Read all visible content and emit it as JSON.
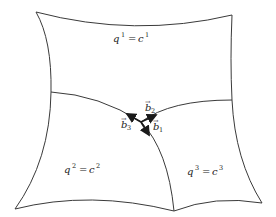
{
  "diagram": {
    "regions": [
      {
        "id": "surface-1",
        "var": "q",
        "index": "1",
        "eq": "=",
        "const": "c",
        "const_index": "1"
      },
      {
        "id": "surface-2",
        "var": "q",
        "index": "2",
        "eq": "=",
        "const": "c",
        "const_index": "2"
      },
      {
        "id": "surface-3",
        "var": "q",
        "index": "3",
        "eq": "=",
        "const": "c",
        "const_index": "3"
      }
    ],
    "vectors": [
      {
        "id": "b1",
        "symbol": "b",
        "index": "1",
        "arrow": "→"
      },
      {
        "id": "b2",
        "symbol": "b",
        "index": "2",
        "arrow": "→"
      },
      {
        "id": "b3",
        "symbol": "b",
        "index": "3",
        "arrow": "→"
      }
    ],
    "colors": {
      "stroke": "#3a3a3a",
      "vector": "#1a1a1a",
      "background": "#ffffff"
    }
  }
}
